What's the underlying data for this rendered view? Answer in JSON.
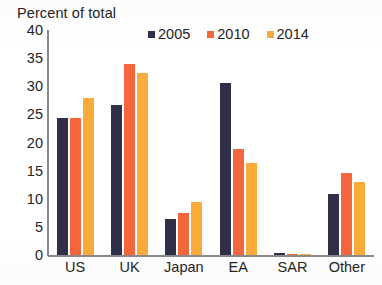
{
  "axis_title": "Percent of total",
  "colors": {
    "series_2005": "#2f2f47",
    "series_2010": "#f4663c",
    "series_2014": "#fbab3a",
    "axis": "#8a8a8a",
    "text": "#242424",
    "background": "#ffffff"
  },
  "legend": {
    "items": [
      {
        "label": "2005",
        "color": "#2f2f47"
      },
      {
        "label": "2010",
        "color": "#f4663c"
      },
      {
        "label": "2014",
        "color": "#fbab3a"
      }
    ]
  },
  "y_axis": {
    "ticks": [
      "40",
      "35",
      "30",
      "25",
      "20",
      "15",
      "10",
      "5",
      "0"
    ]
  },
  "x_axis": {
    "categories": [
      "US",
      "UK",
      "Japan",
      "EA",
      "SAR",
      "Other"
    ]
  },
  "chart_data": {
    "type": "bar",
    "title": "",
    "xlabel": "",
    "ylabel": "Percent of total",
    "ylim": [
      0,
      40
    ],
    "ytick_step": 5,
    "grid": false,
    "legend_position": "top-center",
    "categories": [
      "US",
      "UK",
      "Japan",
      "EA",
      "SAR",
      "Other"
    ],
    "series": [
      {
        "name": "2005",
        "color": "#2f2f47",
        "values": [
          24.3,
          26.7,
          6.4,
          30.5,
          0.4,
          10.8
        ]
      },
      {
        "name": "2010",
        "color": "#f4663c",
        "values": [
          24.3,
          34.0,
          7.5,
          18.8,
          0.2,
          14.5
        ]
      },
      {
        "name": "2014",
        "color": "#fbab3a",
        "values": [
          27.9,
          32.3,
          9.5,
          16.4,
          0.2,
          12.9
        ]
      }
    ]
  }
}
